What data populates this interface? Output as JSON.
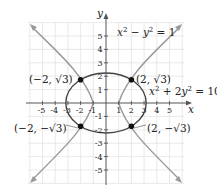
{
  "diagram": {
    "title": "",
    "axes": {
      "x_label": "x",
      "y_label": "y",
      "x_ticks": [
        "-5",
        "-4",
        "-3",
        "-2",
        "-1",
        "1",
        "2",
        "3",
        "4",
        "5"
      ],
      "y_ticks": [
        "5",
        "4",
        "3",
        "2",
        "1",
        "-1",
        "-2",
        "-3",
        "-4",
        "-5"
      ],
      "range": {
        "x": [
          -7,
          7
        ],
        "y": [
          -6.5,
          6.5
        ]
      }
    },
    "curves": [
      {
        "name": "hyperbola",
        "equation_lhs_a": "x",
        "equation_lhs_b": "y",
        "equation": "x² − y² = 1",
        "color": "#9a9a9a"
      },
      {
        "name": "ellipse",
        "equation": "x² + 2y² = 10",
        "color": "#444444"
      }
    ],
    "equation_labels": {
      "hyperbola": {
        "x": "x",
        "exp1": "2",
        "minus": " − ",
        "y": "y",
        "exp2": "2",
        "rhs": " = 1"
      },
      "ellipse": {
        "x": "x",
        "exp1": "2",
        "plus": " + 2",
        "y": "y",
        "exp2": "2",
        "rhs": " = 10"
      }
    },
    "points": [
      {
        "label": "(−2, √3)",
        "x": -2,
        "y": 1.732
      },
      {
        "label": "(2, √3)",
        "x": 2,
        "y": 1.732
      },
      {
        "label": "(−2, −√3)",
        "x": -2,
        "y": -1.732
      },
      {
        "label": "(2, −√3)",
        "x": 2,
        "y": -1.732
      }
    ],
    "colors": {
      "grid": "#e3e3e3",
      "axis": "#555555",
      "ellipse": "#444444",
      "hyperbola": "#9a9a9a",
      "point": "#111111"
    }
  }
}
